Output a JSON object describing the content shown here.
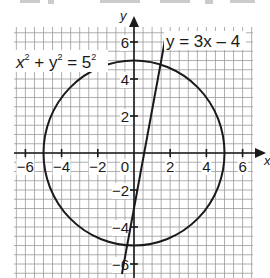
{
  "figure": {
    "top_text_fragment": "y = ... , y = ...",
    "axes": {
      "x_label": "x",
      "y_label": "y",
      "x_ticks": [
        -6,
        -4,
        -2,
        2,
        4,
        6
      ],
      "y_ticks": [
        6,
        4,
        2,
        -2,
        -4,
        -6
      ],
      "origin_label": "0",
      "x_range": [
        -6.5,
        6.5
      ],
      "y_range": [
        -6.8,
        6.8
      ],
      "minor_grid_step": 0.5
    },
    "curves": [
      {
        "name": "circle",
        "equation_base": "x",
        "label_parts": [
          "x",
          "2",
          " + y",
          "2",
          " = 5",
          "2"
        ],
        "center": [
          0,
          0
        ],
        "radius": 5
      },
      {
        "name": "line",
        "label": "y = 3x – 4",
        "slope": 3,
        "intercept": -4
      }
    ],
    "colors": {
      "ink": "#1a1a1a",
      "grid": "#9a9a9a",
      "background": "#ffffff"
    }
  }
}
